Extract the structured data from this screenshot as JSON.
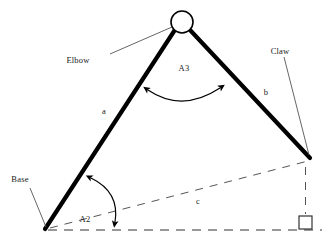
{
  "diagram": {
    "background_color": "#ffffff",
    "line_color": "#000000",
    "labels": {
      "elbow": "Elbow",
      "claw": "Claw",
      "base": "Base",
      "angle_top": "A3",
      "angle_base": "A2",
      "segment_a": "a",
      "segment_b": "b",
      "segment_c": "c"
    },
    "icons": {
      "elbow_joint": "circle-joint-icon",
      "claw_gripper": "square-gripper-icon",
      "angle_arc_top": "double-arrow-arc-icon",
      "angle_arc_base": "single-arrow-arc-icon"
    },
    "geometry": {
      "elbow_joint": {
        "cx": 182,
        "cy": 22,
        "r": 11
      },
      "base_vertex": {
        "x": 45,
        "y": 230
      },
      "claw_tip": {
        "x": 310,
        "y": 158
      },
      "gripper_square": {
        "x": 299,
        "y": 216,
        "size": 13
      },
      "ground_line_y": 230
    }
  }
}
